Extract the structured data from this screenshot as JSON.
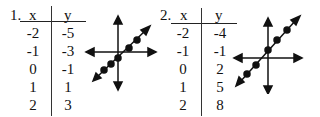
{
  "problems": [
    {
      "number": "1.",
      "headers": {
        "x": "x",
        "y": "y"
      },
      "rows": [
        {
          "x": "-2",
          "y": "-5"
        },
        {
          "x": "-1",
          "y": "-3"
        },
        {
          "x": "0",
          "y": "-1"
        },
        {
          "x": "1",
          "y": "1"
        },
        {
          "x": "2",
          "y": "3"
        }
      ],
      "graph": {
        "icon": "line-graph-icon",
        "description": "line through origin area with positive slope, 5 points, arrows on axes"
      }
    },
    {
      "number": "2.",
      "headers": {
        "x": "x",
        "y": "y"
      },
      "rows": [
        {
          "x": "-2",
          "y": "-4"
        },
        {
          "x": "-1",
          "y": "-1"
        },
        {
          "x": "0",
          "y": "2"
        },
        {
          "x": "1",
          "y": "5"
        },
        {
          "x": "2",
          "y": "8"
        }
      ],
      "graph": {
        "icon": "line-graph-icon",
        "description": "steeper line with positive slope, y-intercept above origin, 5 points, arrows on axes"
      }
    }
  ]
}
